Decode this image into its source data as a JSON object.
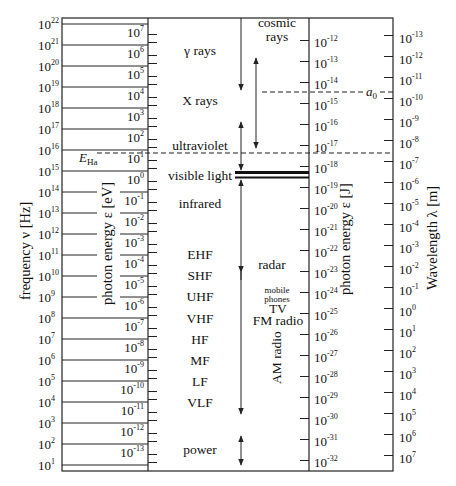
{
  "axes": {
    "frequency": {
      "label": "frequency ν  [Hz]",
      "exponents": [
        22,
        21,
        20,
        19,
        18,
        17,
        16,
        15,
        14,
        13,
        12,
        11,
        10,
        9,
        8,
        7,
        6,
        5,
        4,
        3,
        2,
        1
      ],
      "base": "10"
    },
    "photon_energy_eV": {
      "label": "photon energy ε  [eV]",
      "exponents": [
        7,
        6,
        5,
        4,
        3,
        2,
        1,
        0,
        -1,
        -2,
        -3,
        -4,
        -5,
        -6,
        -7,
        -8,
        -9,
        -10,
        -11,
        -12,
        -13
      ],
      "base": "10"
    },
    "photon_energy_J": {
      "label": "photon energy ε  [J]",
      "exponents": [
        -12,
        -13,
        -14,
        -15,
        -16,
        -17,
        -18,
        -19,
        -20,
        -21,
        -22,
        -23,
        -24,
        -25,
        -26,
        -27,
        -28,
        -29,
        -30,
        -31,
        -32
      ],
      "base": "10"
    },
    "wavelength": {
      "label": "Wavelength λ  [m]",
      "exponents": [
        -13,
        -12,
        -11,
        -10,
        -9,
        -8,
        -7,
        -6,
        -5,
        -4,
        -3,
        -2,
        -1,
        0,
        1,
        2,
        3,
        4,
        5,
        6,
        7
      ],
      "base": "10"
    }
  },
  "bands": [
    {
      "label": "γ rays",
      "y": 50
    },
    {
      "label": "X rays",
      "y": 100
    },
    {
      "label": "ultraviolet",
      "y": 145
    },
    {
      "label": "visible light",
      "y": 175
    },
    {
      "label": "infrared",
      "y": 203
    },
    {
      "label": "EHF",
      "y": 254
    },
    {
      "label": "SHF",
      "y": 275
    },
    {
      "label": "UHF",
      "y": 296
    },
    {
      "label": "VHF",
      "y": 318
    },
    {
      "label": "HF",
      "y": 339
    },
    {
      "label": "MF",
      "y": 360
    },
    {
      "label": "LF",
      "y": 381
    },
    {
      "label": "VLF",
      "y": 402
    },
    {
      "label": "power",
      "y": 449
    }
  ],
  "sources": {
    "cosmic_rays_line1": "cosmic",
    "cosmic_rays_line2": "rays",
    "radar": "radar",
    "mobile_line1": "mobile",
    "mobile_line2": "phones",
    "tv": "TV",
    "fm_radio": "FM radio",
    "am_radio": "AM radio"
  },
  "markers": {
    "hydrogen_ionization": {
      "label": "E",
      "subscript": "Ha"
    },
    "bohr_radius": {
      "label": "a",
      "subscript": "0"
    }
  },
  "colors": {
    "line": "#222222",
    "band_line": "#111111",
    "grid": "#555555"
  }
}
